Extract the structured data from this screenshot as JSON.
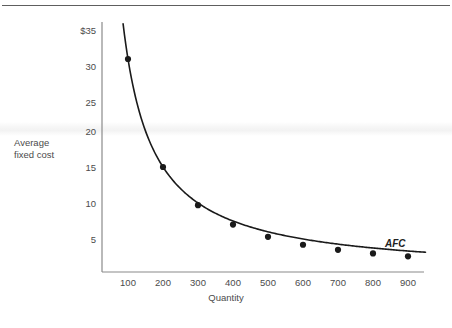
{
  "figure": {
    "background_color": "#ffffff",
    "rule_color": "#5e5e5e",
    "axis_color": "#8a8a8a",
    "curve_color": "#1a1a1a",
    "text_color": "#4b4b4b",
    "series_label": "AFC",
    "y_axis_title_line1": "Average",
    "y_axis_title_line2": "fixed cost"
  },
  "chart_data": {
    "type": "line",
    "title": "",
    "subtitle": "",
    "xlabel": "Quantity",
    "ylabel": "Average fixed cost",
    "grid": false,
    "legend_position": "inline-right",
    "annotations": [
      {
        "text": "AFC",
        "x": 870,
        "y": 4.4,
        "style": "italic"
      }
    ],
    "xlim": [
      0,
      960
    ],
    "ylim": [
      0,
      37
    ],
    "xticks": [
      100,
      200,
      300,
      400,
      500,
      600,
      700,
      800,
      900
    ],
    "xtick_labels": [
      "100",
      "200",
      "300",
      "400",
      "500",
      "600",
      "700",
      "800",
      "900"
    ],
    "yticks": [
      5,
      10,
      15,
      20,
      25,
      30,
      35
    ],
    "ytick_labels": [
      "5",
      "10",
      "15",
      "20",
      "25",
      "30",
      "$35"
    ],
    "series": [
      {
        "name": "AFC",
        "markers": true,
        "x": [
          100,
          200,
          300,
          400,
          500,
          600,
          700,
          800,
          900
        ],
        "values": [
          30,
          15,
          9.7,
          7,
          5.3,
          4.2,
          3.5,
          3,
          2.6
        ]
      }
    ],
    "curve_start": {
      "x": 86,
      "y": 35
    },
    "curve_end": {
      "x": 950,
      "y": 2.5
    }
  }
}
